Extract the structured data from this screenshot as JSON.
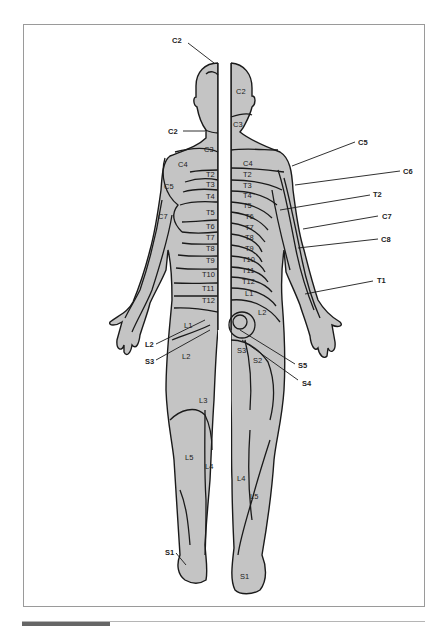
{
  "diagram": {
    "fill_color": "#c4c4c4",
    "line_color": "#1a1a1a",
    "external_labels": [
      {
        "id": "c2-top",
        "text": "C2",
        "x": 172,
        "y": 43
      },
      {
        "id": "c2-neck",
        "text": "C2",
        "x": 168,
        "y": 132
      },
      {
        "id": "c5-right",
        "text": "C5",
        "x": 358,
        "y": 145
      },
      {
        "id": "c6-right",
        "text": "C6",
        "x": 403,
        "y": 174
      },
      {
        "id": "t2-right",
        "text": "T2",
        "x": 373,
        "y": 197
      },
      {
        "id": "c7-right",
        "text": "C7",
        "x": 382,
        "y": 219
      },
      {
        "id": "c8-right",
        "text": "C8",
        "x": 381,
        "y": 242
      },
      {
        "id": "t1-right",
        "text": "T1",
        "x": 377,
        "y": 283
      },
      {
        "id": "l2-left",
        "text": "L2",
        "x": 145,
        "y": 347
      },
      {
        "id": "s3-left",
        "text": "S3",
        "x": 145,
        "y": 364
      },
      {
        "id": "s5-right",
        "text": "S5",
        "x": 298,
        "y": 366
      },
      {
        "id": "s4-right",
        "text": "S4",
        "x": 302,
        "y": 384
      },
      {
        "id": "s1-left",
        "text": "S1",
        "x": 166,
        "y": 555
      }
    ],
    "left_internal_labels": [
      {
        "text": "C3",
        "x": 204,
        "y": 152
      },
      {
        "text": "C4",
        "x": 178,
        "y": 166
      },
      {
        "text": "T2",
        "x": 206,
        "y": 176
      },
      {
        "text": "T3",
        "x": 206,
        "y": 186
      },
      {
        "text": "C5",
        "x": 164,
        "y": 188
      },
      {
        "text": "T4",
        "x": 206,
        "y": 198
      },
      {
        "text": "C7",
        "x": 158,
        "y": 218
      },
      {
        "text": "T5",
        "x": 206,
        "y": 214
      },
      {
        "text": "T6",
        "x": 206,
        "y": 228
      },
      {
        "text": "T7",
        "x": 206,
        "y": 239
      },
      {
        "text": "T8",
        "x": 206,
        "y": 250
      },
      {
        "text": "T9",
        "x": 206,
        "y": 262
      },
      {
        "text": "T10",
        "x": 202,
        "y": 276
      },
      {
        "text": "T11",
        "x": 202,
        "y": 290
      },
      {
        "text": "T12",
        "x": 202,
        "y": 302
      },
      {
        "text": "L1",
        "x": 184,
        "y": 327
      },
      {
        "text": "L2",
        "x": 182,
        "y": 358
      },
      {
        "text": "L3",
        "x": 199,
        "y": 402
      },
      {
        "text": "L5",
        "x": 185,
        "y": 459
      },
      {
        "text": "L4",
        "x": 205,
        "y": 468
      }
    ],
    "right_internal_labels": [
      {
        "text": "C2",
        "x": 236,
        "y": 93
      },
      {
        "text": "C3",
        "x": 233,
        "y": 126
      },
      {
        "text": "C4",
        "x": 243,
        "y": 165
      },
      {
        "text": "T2",
        "x": 243,
        "y": 176
      },
      {
        "text": "T3",
        "x": 243,
        "y": 187
      },
      {
        "text": "T4",
        "x": 243,
        "y": 197
      },
      {
        "text": "T5",
        "x": 243,
        "y": 206
      },
      {
        "text": "T6",
        "x": 245,
        "y": 217
      },
      {
        "text": "T7",
        "x": 245,
        "y": 228
      },
      {
        "text": "T8",
        "x": 245,
        "y": 238
      },
      {
        "text": "T9",
        "x": 245,
        "y": 249
      },
      {
        "text": "T10",
        "x": 242,
        "y": 261
      },
      {
        "text": "T11",
        "x": 242,
        "y": 271
      },
      {
        "text": "T12",
        "x": 242,
        "y": 282
      },
      {
        "text": "L1",
        "x": 245,
        "y": 295
      },
      {
        "text": "L2",
        "x": 258,
        "y": 314
      },
      {
        "text": "S3",
        "x": 237,
        "y": 352
      },
      {
        "text": "S2",
        "x": 253,
        "y": 362
      },
      {
        "text": "L4",
        "x": 237,
        "y": 480
      },
      {
        "text": "L5",
        "x": 250,
        "y": 498
      },
      {
        "text": "S1",
        "x": 240,
        "y": 578
      }
    ]
  }
}
